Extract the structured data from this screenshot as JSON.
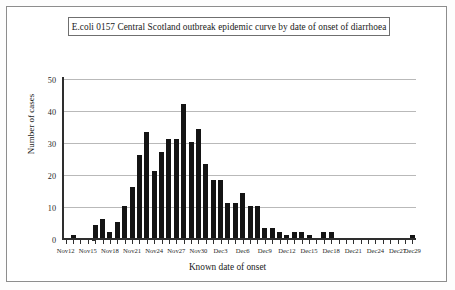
{
  "chart_data": {
    "type": "bar",
    "title": "E.coli 0157 Central Scotland outbreak epidemic curve by date of onset of diarrhoea",
    "xlabel": "Known date of onset",
    "ylabel": "Number of cases",
    "ylim": [
      0,
      50
    ],
    "yticks": [
      0,
      10,
      20,
      30,
      40,
      50
    ],
    "grid": true,
    "legend": null,
    "categories": [
      "Nov12",
      "Nov13",
      "Nov14",
      "Nov15",
      "Nov16",
      "Nov17",
      "Nov18",
      "Nov19",
      "Nov20",
      "Nov21",
      "Nov22",
      "Nov23",
      "Nov24",
      "Nov25",
      "Nov26",
      "Nov27",
      "Nov28",
      "Nov29",
      "Nov30",
      "Dec1",
      "Dec2",
      "Dec3",
      "Dec4",
      "Dec5",
      "Dec6",
      "Dec7",
      "Dec8",
      "Dec9",
      "Dec10",
      "Dec11",
      "Dec12",
      "Dec13",
      "Dec14",
      "Dec15",
      "Dec16",
      "Dec17",
      "Dec18",
      "Dec19",
      "Dec20",
      "Dec21",
      "Dec22",
      "Dec23",
      "Dec24",
      "Dec25",
      "Dec26",
      "Dec27",
      "Dec28",
      "Dec29"
    ],
    "values": [
      0,
      1,
      0,
      0,
      4,
      6,
      2,
      5,
      10,
      16,
      26,
      33,
      21,
      27,
      31,
      31,
      42,
      30,
      34,
      23,
      18,
      18,
      11,
      11,
      14,
      10,
      10,
      3,
      3,
      2,
      1,
      2,
      2,
      1,
      0,
      2,
      2,
      0,
      0,
      0,
      0,
      0,
      0,
      0,
      0,
      0,
      0,
      1
    ],
    "xtick_labels": [
      "Nov12",
      "Nov15",
      "Nov18",
      "Nov21",
      "Nov24",
      "Nov27",
      "Nov30",
      "Dec3",
      "Dec6",
      "Dec9",
      "Dec12",
      "Dec15",
      "Dec18",
      "Dec21",
      "Dec24",
      "Dec27",
      "Dec29"
    ],
    "xtick_indices": [
      0,
      3,
      6,
      9,
      12,
      15,
      18,
      21,
      24,
      27,
      30,
      33,
      36,
      39,
      42,
      45,
      47
    ],
    "bar_color": "#141414",
    "grid_color": "#b9b9b9",
    "axis_color": "#2e2e2e"
  }
}
